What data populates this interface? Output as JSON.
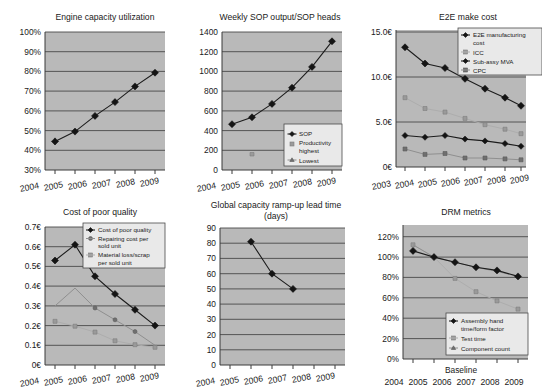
{
  "page": {
    "background": "#ffffff",
    "panel_background": "#bdbdbd",
    "series_colors": {
      "primary": "#141414",
      "secondary": "#a8a8a8",
      "tertiary": "#7d7d7d"
    }
  },
  "charts": [
    {
      "id": "engine-capacity-utilization",
      "type": "line",
      "title": "Engine capacity utilization",
      "xlabel": "",
      "ylabel": "",
      "categories": [
        "2004",
        "2005",
        "2006",
        "2007",
        "2008",
        "2009"
      ],
      "ytick_labels": [
        "30%",
        "40%",
        "50%",
        "60%",
        "70%",
        "80%",
        "90%",
        "100%"
      ],
      "yticks": [
        30,
        40,
        50,
        60,
        70,
        80,
        90,
        100
      ],
      "ylim": [
        30,
        100
      ],
      "grid": true,
      "legend": null,
      "series": [
        {
          "name": "Engine capacity utilization",
          "style": "primary",
          "values": [
            45,
            50,
            58,
            65,
            73,
            80
          ]
        }
      ]
    },
    {
      "id": "weekly-sop-output",
      "type": "line",
      "title": "Weekly SOP output/SOP heads",
      "xlabel": "",
      "ylabel": "",
      "categories": [
        "2004",
        "2005",
        "2006",
        "2007",
        "2008",
        "2009"
      ],
      "ytick_labels": [
        "0",
        "200",
        "400",
        "600",
        "800",
        "1000",
        "1200",
        "1400"
      ],
      "yticks": [
        0,
        200,
        400,
        600,
        800,
        1000,
        1200,
        1400
      ],
      "ylim": [
        0,
        1400
      ],
      "grid": true,
      "legend": {
        "position": "bottom-right",
        "entries": [
          "SOP",
          "Productivity highest",
          "Lowest"
        ]
      },
      "series": [
        {
          "name": "SOP",
          "style": "primary",
          "values": [
            465,
            535,
            670,
            835,
            1045,
            1305
          ]
        },
        {
          "name": "Productivity highest",
          "style": "secondary",
          "values": [
            215,
            null,
            null,
            null,
            null,
            null
          ]
        },
        {
          "name": "Lowest",
          "style": "tertiary",
          "values": [
            null,
            null,
            null,
            null,
            null,
            null
          ]
        }
      ]
    },
    {
      "id": "e2e-make-cost",
      "type": "line",
      "title": "E2E make cost",
      "xlabel": "",
      "ylabel": "",
      "categories": [
        "2003",
        "2004",
        "2005",
        "2006",
        "2007",
        "2008",
        "2009"
      ],
      "ytick_labels": [
        "0€",
        "5.0€",
        "10.0€",
        "15.0€"
      ],
      "yticks": [
        0,
        5,
        10,
        15
      ],
      "ylim": [
        0,
        15
      ],
      "grid": true,
      "legend": {
        "position": "top-right",
        "entries": [
          "E2E manufacturing cost",
          "ICC",
          "Sub-assy MVA",
          "CPC"
        ]
      },
      "series": [
        {
          "name": "E2E manufacturing cost",
          "style": "primary",
          "values": [
            13.3,
            11.5,
            11.0,
            9.8,
            8.7,
            7.7,
            6.8
          ]
        },
        {
          "name": "ICC",
          "style": "secondary",
          "values": [
            7.7,
            6.5,
            6.1,
            5.4,
            4.7,
            4.2,
            3.7
          ]
        },
        {
          "name": "Sub-assy MVA",
          "style": "tertiary",
          "values": [
            3.5,
            3.3,
            3.5,
            3.1,
            2.9,
            2.6,
            2.3
          ]
        },
        {
          "name": "CPC",
          "style": "quaternary",
          "values": [
            2.0,
            1.4,
            1.5,
            1.0,
            1.0,
            0.9,
            0.8
          ]
        }
      ]
    },
    {
      "id": "cost-of-poor-quality",
      "type": "line",
      "title": "Cost of poor quality",
      "xlabel": "",
      "ylabel": "",
      "categories": [
        "2004",
        "2005",
        "2006",
        "2007",
        "2008",
        "2009"
      ],
      "ytick_labels": [
        "0€",
        "0.1€",
        "0.2€",
        "0.3€",
        "0.4€",
        "0.5€",
        "0.6€",
        "0.7€"
      ],
      "yticks": [
        0,
        0.1,
        0.2,
        0.3,
        0.4,
        0.5,
        0.6,
        0.7
      ],
      "ylim": [
        0,
        0.7
      ],
      "grid": true,
      "legend": {
        "position": "top-right",
        "entries": [
          "Cost of poor quality",
          "Repairing cost per sold unit",
          "Material loss/scrap per sold unit"
        ]
      },
      "series": [
        {
          "name": "Cost of poor quality",
          "style": "primary",
          "values": [
            0.53,
            0.61,
            0.45,
            0.36,
            0.28,
            0.2
          ]
        },
        {
          "name": "Repairing cost per sold unit",
          "style": "secondary",
          "values": [
            0.3,
            0.39,
            0.29,
            0.23,
            0.17,
            0.1
          ]
        },
        {
          "name": "Material loss/scrap per sold unit",
          "style": "tertiary",
          "values": [
            0.225,
            0.2,
            0.17,
            0.125,
            0.105,
            0.09
          ]
        }
      ]
    },
    {
      "id": "global-capacity-ramp-up-lead-time",
      "type": "line",
      "title": "Global capacity ramp-up lead time",
      "subtitle": "(days)",
      "xlabel": "",
      "ylabel": "",
      "categories": [
        "2004",
        "2005",
        "2006",
        "2007",
        "2008",
        "2009"
      ],
      "ytick_labels": [
        "0",
        "10",
        "20",
        "30",
        "40",
        "50",
        "60",
        "70",
        "80",
        "90"
      ],
      "yticks": [
        0,
        10,
        20,
        30,
        40,
        50,
        60,
        70,
        80,
        90
      ],
      "ylim": [
        0,
        90
      ],
      "grid": true,
      "legend": null,
      "series": [
        {
          "name": "Global capacity ramp-up lead time",
          "style": "primary",
          "values": [
            null,
            81,
            60,
            50,
            null,
            null
          ]
        }
      ]
    },
    {
      "id": "drm-metrics",
      "type": "line",
      "title": "DRM metrics",
      "xlabel": "Baseline",
      "ylabel": "",
      "categories": [
        "2004",
        "2005",
        "2006",
        "2007",
        "2008",
        "2009"
      ],
      "ytick_labels": [
        "0%",
        "20%",
        "40%",
        "60%",
        "80%",
        "100%",
        "120%"
      ],
      "yticks": [
        0,
        20,
        40,
        60,
        80,
        100,
        120
      ],
      "ylim": [
        0,
        120
      ],
      "grid": true,
      "legend": {
        "position": "bottom-right",
        "entries": [
          "Assembly hand time/form factor",
          "Test time",
          "Component count"
        ]
      },
      "series": [
        {
          "name": "Assembly hand time/form factor",
          "style": "primary",
          "values": [
            104,
            100,
            95,
            90,
            87,
            81
          ]
        },
        {
          "name": "Test time",
          "style": "secondary",
          "values": [
            112,
            100,
            79,
            66,
            57,
            49
          ]
        },
        {
          "name": "Component count",
          "style": "tertiary",
          "values": [
            112,
            100,
            95,
            90,
            86,
            81
          ]
        }
      ]
    }
  ]
}
